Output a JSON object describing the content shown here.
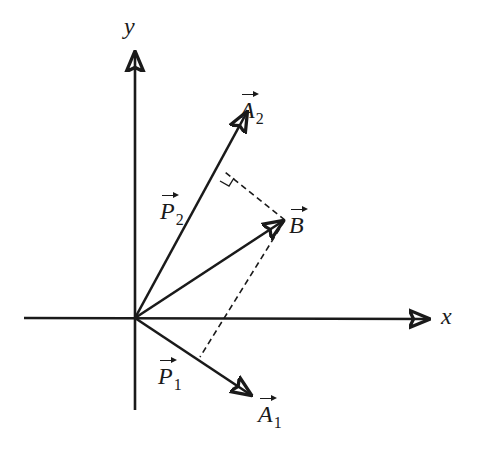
{
  "diagram": {
    "axes": {
      "x_label": "x",
      "y_label": "y"
    },
    "vectors": {
      "A1": {
        "symbol": "A",
        "subscript": "1"
      },
      "A2": {
        "symbol": "A",
        "subscript": "2"
      },
      "B": {
        "symbol": "B",
        "subscript": ""
      },
      "P1": {
        "symbol": "P",
        "subscript": "1"
      },
      "P2": {
        "symbol": "P",
        "subscript": "2"
      }
    },
    "geometry": {
      "origin": [
        135,
        318
      ],
      "x_axis": {
        "from": [
          24,
          318
        ],
        "to": [
          431,
          318
        ]
      },
      "y_axis": {
        "from": [
          135,
          410
        ],
        "to": [
          135,
          50
        ]
      },
      "A1_tip": [
        253,
        396
      ],
      "A2_tip": [
        248,
        110
      ],
      "B_tip": [
        285,
        220
      ],
      "proj_foot_A1": [
        200,
        357
      ],
      "proj_foot_A2": [
        225,
        172
      ]
    },
    "colors": {
      "line": "#1a1a1a",
      "background": "#ffffff"
    }
  }
}
